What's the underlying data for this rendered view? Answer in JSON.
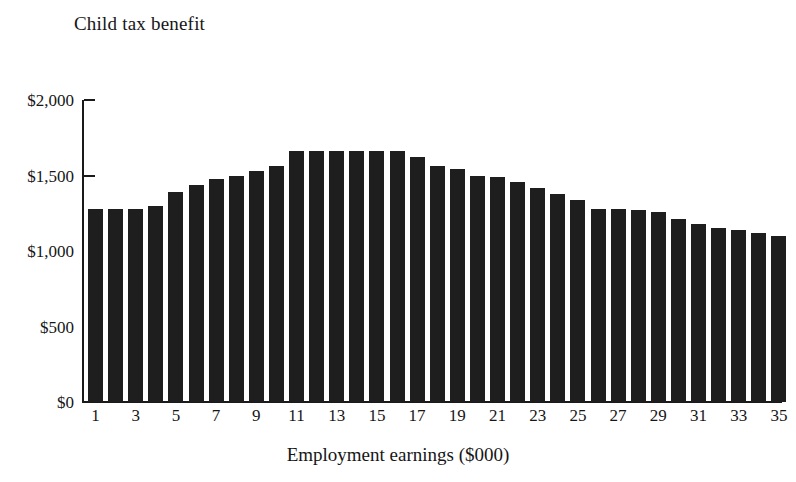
{
  "chart_data": {
    "type": "bar",
    "title": "Child tax benefit",
    "subtitle": "",
    "xlabel": "Employment earnings ($000)",
    "ylabel": "",
    "ylim": [
      0,
      2000
    ],
    "xlim": [
      1,
      35
    ],
    "grid": false,
    "legend": null,
    "bar_color": "#1e1e1e",
    "y_ticks": [
      0,
      500,
      1000,
      1500,
      2000
    ],
    "y_tick_labels": [
      "$0",
      "$500",
      "$1,000",
      "$1,500",
      "$2,000"
    ],
    "x_tick_labels": [
      "1",
      "3",
      "5",
      "7",
      "9",
      "11",
      "13",
      "15",
      "17",
      "19",
      "21",
      "23",
      "25",
      "27",
      "29",
      "31",
      "33",
      "35"
    ],
    "categories": [
      1,
      2,
      3,
      4,
      5,
      6,
      7,
      8,
      9,
      10,
      11,
      12,
      13,
      14,
      15,
      16,
      17,
      18,
      19,
      20,
      21,
      22,
      23,
      24,
      25,
      26,
      27,
      28,
      29,
      30,
      31,
      32,
      33,
      34,
      35
    ],
    "values": [
      1280,
      1280,
      1280,
      1300,
      1390,
      1440,
      1480,
      1500,
      1530,
      1560,
      1660,
      1660,
      1660,
      1660,
      1660,
      1660,
      1620,
      1560,
      1540,
      1500,
      1490,
      1460,
      1420,
      1380,
      1340,
      1280,
      1275,
      1270,
      1260,
      1210,
      1180,
      1155,
      1140,
      1120,
      1100
    ],
    "units": "dollars"
  },
  "figure": {
    "title": "Child tax benefit",
    "x_axis_title": "Employment earnings ($000)"
  }
}
